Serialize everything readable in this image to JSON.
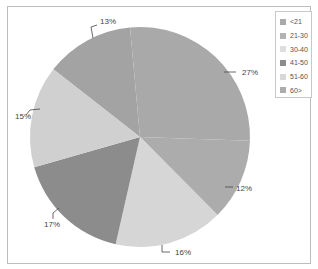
{
  "chart_data": {
    "type": "pie",
    "title": "",
    "legend_position": "top-right",
    "categories": [
      "<21",
      "21-30",
      "30-40",
      "41-50",
      "51-60",
      "60>"
    ],
    "values": [
      13,
      27,
      12,
      16,
      17,
      15
    ],
    "labels": [
      "13%",
      "27%",
      "12%",
      "16%",
      "17%",
      "15%"
    ],
    "slice_colors": [
      "#a3a3a3",
      "#a9a9a9",
      "#acacac",
      "#d6d6d6",
      "#8c8c8c",
      "#d0d0d0"
    ],
    "legend": [
      {
        "label": "<21",
        "color": "#a9a9a9"
      },
      {
        "label": "21-30",
        "color": "#b3b3b3"
      },
      {
        "label": "30-40",
        "color": "#dedede"
      },
      {
        "label": "41-50",
        "color": "#8c8c8c"
      },
      {
        "label": "51-60",
        "color": "#d8d8d8"
      },
      {
        "label": "60>",
        "color": "#acacac"
      }
    ]
  }
}
